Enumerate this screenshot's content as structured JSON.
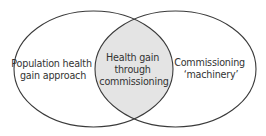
{
  "diagram": {
    "type": "venn",
    "colors": {
      "stroke": "#3a3a3a",
      "background": "#ffffff",
      "intersection_fill": "#e4e4e4",
      "text": "#333333"
    },
    "left_set": {
      "label_lines": [
        "Population health",
        "gain approach"
      ]
    },
    "right_set": {
      "label_lines": [
        "Commissioning",
        "‘machinery’"
      ]
    },
    "intersection": {
      "label_lines": [
        "Health gain",
        "through",
        "commissioning"
      ]
    }
  }
}
